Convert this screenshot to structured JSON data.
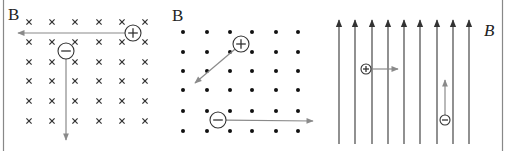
{
  "diagram": {
    "panels": [
      {
        "id": "into-page",
        "field_label": "B",
        "field_label_italic": false,
        "field_direction": "into-page",
        "field_symbol": "×",
        "grid": {
          "cols": [
            29,
            52,
            75,
            99,
            122,
            145
          ],
          "rows": [
            22,
            42,
            62,
            81,
            101,
            121
          ]
        },
        "charges": [
          {
            "sign": "+",
            "x": 133,
            "y": 33,
            "r": 8,
            "velocity_to": [
              18,
              33
            ],
            "velocity_direction": "left"
          },
          {
            "sign": "−",
            "x": 66,
            "y": 51,
            "r": 8,
            "velocity_to": [
              66,
              140
            ],
            "velocity_direction": "down"
          }
        ]
      },
      {
        "id": "out-of-page",
        "field_label": "B",
        "field_label_italic": false,
        "field_direction": "out-of-page",
        "field_symbol": "•",
        "grid": {
          "cols": [
            183,
            207,
            230,
            252,
            276,
            298
          ],
          "rows": [
            32,
            52,
            71,
            90,
            111,
            131
          ]
        },
        "charges": [
          {
            "sign": "+",
            "x": 241,
            "y": 44,
            "r": 8,
            "velocity_to": [
              195,
              83
            ],
            "velocity_direction": "down-left"
          },
          {
            "sign": "−",
            "x": 218,
            "y": 120,
            "r": 8,
            "velocity_to": [
              313,
              121
            ],
            "velocity_direction": "right"
          }
        ]
      },
      {
        "id": "upward",
        "field_label": "B",
        "field_label_italic": true,
        "field_direction": "up",
        "field_lines_x": [
          339,
          355,
          372,
          388,
          404,
          420,
          437,
          453,
          469
        ],
        "field_lines_top": 20,
        "field_lines_bottom": 144,
        "charges": [
          {
            "sign": "+",
            "x": 366,
            "y": 69,
            "r": 5,
            "velocity_to": [
              398,
              69
            ],
            "velocity_direction": "right"
          },
          {
            "sign": "−",
            "x": 445,
            "y": 120,
            "r": 5,
            "velocity_to": [
              445,
              80
            ],
            "velocity_direction": "up"
          }
        ]
      }
    ],
    "labels": {
      "panel1_B": "B",
      "panel2_B": "B",
      "panel3_B": "B"
    },
    "colors": {
      "field_line": "#555555",
      "velocity_arrow": "#8a8a8a",
      "charge_outline": "#333333",
      "border": "#888888"
    }
  }
}
